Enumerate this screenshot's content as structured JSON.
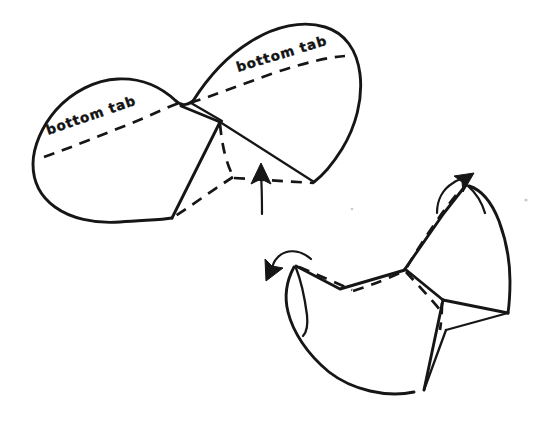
{
  "figure": {
    "medium": "hand-drawn ink line diagram",
    "background_color": "#ffffff",
    "ink_color": "#161616"
  },
  "labels": {
    "left_tab": "bottom tab",
    "right_tab": "bottom tab"
  },
  "steps": [
    {
      "id": "step-flat",
      "name": "flat-pattern-with-tabs",
      "description": "Flattened two-lobed shape with dashed bottom tab fold lines and a central triangular flap",
      "labels": [
        "bottom tab",
        "bottom tab"
      ],
      "arrows": 1
    },
    {
      "id": "step-folded",
      "name": "folded-three-dimensional-form",
      "description": "Three dimensional folded form with two curved rotation arrows",
      "labels": [],
      "arrows": 2
    }
  ],
  "arrows": {
    "center_up": {
      "name": "fold-up-arrow",
      "direction": "up"
    },
    "lower_left": {
      "name": "rotate-left-arrow",
      "direction": "down-left"
    },
    "lower_right": {
      "name": "rotate-right-arrow",
      "direction": "up-right"
    }
  },
  "line_styles": {
    "solid": "cut or visible edge",
    "dashed": "fold line / hidden edge"
  }
}
